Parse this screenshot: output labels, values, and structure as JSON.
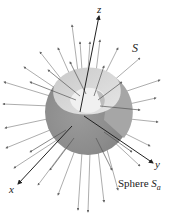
{
  "figure": {
    "labels": {
      "z_axis": "z",
      "x_axis": "x",
      "y_axis": "y",
      "surface": "S",
      "sphere_prefix": "Sphere ",
      "sphere_symbol": "S",
      "sphere_subscript": "a"
    },
    "colors": {
      "sphere_dark": "#8f8f8f",
      "sphere_mid": "#b4b4b4",
      "sphere_light": "#dcdcdc",
      "arrow": "#555555",
      "axis": "#333333"
    }
  }
}
